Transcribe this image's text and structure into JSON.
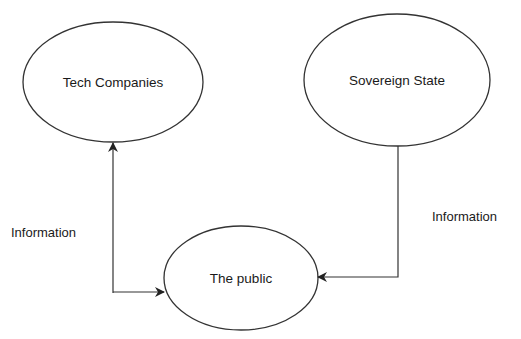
{
  "diagram": {
    "type": "flow",
    "background": "#ffffff",
    "stroke_color": "#333333",
    "nodes": [
      {
        "id": "tech",
        "label": "Tech Companies",
        "shape": "ellipse"
      },
      {
        "id": "state",
        "label": "Sovereign State",
        "shape": "ellipse"
      },
      {
        "id": "public",
        "label": "The public",
        "shape": "ellipse"
      }
    ],
    "edges": [
      {
        "from": "tech",
        "to": "public",
        "label": "Information",
        "direction": "bidirectional"
      },
      {
        "from": "state",
        "to": "public",
        "label": "Information",
        "direction": "to-public"
      }
    ]
  }
}
